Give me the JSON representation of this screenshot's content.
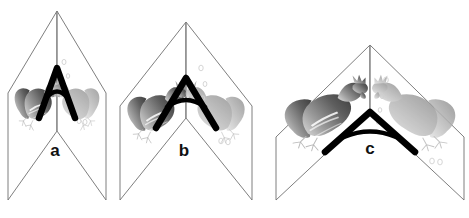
{
  "figure": {
    "type": "diagram",
    "background_color": "#ffffff",
    "width": 469,
    "height": 218,
    "panels": [
      {
        "id": "a",
        "label": "a",
        "label_x": 55,
        "label_y": 152,
        "apex": {
          "x": 57,
          "y": 11
        },
        "hinge_top": {
          "x": 57,
          "y": 11
        },
        "hinge_bottom": {
          "x": 57,
          "y": 131
        },
        "left_page": [
          {
            "x": 57,
            "y": 11
          },
          {
            "x": 8,
            "y": 93
          },
          {
            "x": 8,
            "y": 200
          },
          {
            "x": 57,
            "y": 131
          }
        ],
        "right_page": [
          {
            "x": 57,
            "y": 11
          },
          {
            "x": 106,
            "y": 93
          },
          {
            "x": 106,
            "y": 200
          },
          {
            "x": 57,
            "y": 131
          }
        ],
        "angle_marker": {
          "apex": {
            "x": 57,
            "y": 68
          },
          "left_foot": {
            "x": 39,
            "y": 118
          },
          "right_foot": {
            "x": 75,
            "y": 118
          },
          "stroke_width": 6.5,
          "arc_rise": 18,
          "color": "#000000"
        },
        "opening": "narrow",
        "bird_scale": 0.62
      },
      {
        "id": "b",
        "label": "b",
        "label_x": 184,
        "label_y": 152,
        "apex": {
          "x": 186,
          "y": 22
        },
        "hinge_top": {
          "x": 186,
          "y": 22
        },
        "hinge_bottom": {
          "x": 186,
          "y": 118
        },
        "left_page": [
          {
            "x": 186,
            "y": 22
          },
          {
            "x": 120,
            "y": 106
          },
          {
            "x": 120,
            "y": 200
          },
          {
            "x": 186,
            "y": 118
          }
        ],
        "right_page": [
          {
            "x": 186,
            "y": 22
          },
          {
            "x": 252,
            "y": 106
          },
          {
            "x": 252,
            "y": 200
          },
          {
            "x": 186,
            "y": 118
          }
        ],
        "angle_marker": {
          "apex": {
            "x": 186,
            "y": 78
          },
          "left_foot": {
            "x": 156,
            "y": 128
          },
          "right_foot": {
            "x": 216,
            "y": 128
          },
          "stroke_width": 6.5,
          "arc_rise": 20,
          "color": "#000000"
        },
        "opening": "medium",
        "bird_scale": 0.8
      },
      {
        "id": "c",
        "label": "c",
        "label_x": 370,
        "label_y": 150,
        "apex": {
          "x": 370,
          "y": 45
        },
        "hinge_top": {
          "x": 370,
          "y": 45
        },
        "hinge_bottom": {
          "x": 370,
          "y": 112
        },
        "left_page": [
          {
            "x": 370,
            "y": 45
          },
          {
            "x": 276,
            "y": 137
          },
          {
            "x": 276,
            "y": 200
          },
          {
            "x": 370,
            "y": 112
          }
        ],
        "right_page": [
          {
            "x": 370,
            "y": 45
          },
          {
            "x": 464,
            "y": 137
          },
          {
            "x": 464,
            "y": 200
          },
          {
            "x": 370,
            "y": 112
          }
        ],
        "angle_marker": {
          "apex": {
            "x": 370,
            "y": 112
          },
          "left_foot": {
            "x": 325,
            "y": 152
          },
          "right_foot": {
            "x": 415,
            "y": 152
          },
          "stroke_width": 6.5,
          "arc_rise": 22,
          "color": "#000000"
        },
        "opening": "wide",
        "bird_scale": 1.0
      }
    ],
    "bird": {
      "name": "rooster",
      "real_fill_dark": "#4a4a4a",
      "real_fill_mid": "#8a8a8a",
      "real_fill_light": "#c8c8c8",
      "reflection_fill_dark": "#9a9a9a",
      "reflection_fill_light": "#d8d8d8",
      "outline_color": "#b9b9b9"
    },
    "speck_color": "#cfcfcf",
    "line_color": "#6f6f6f",
    "label_color": "#111111"
  }
}
